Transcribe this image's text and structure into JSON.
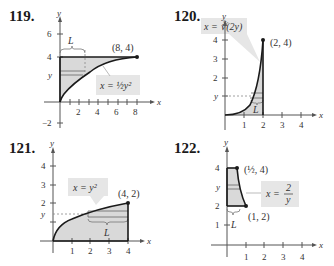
{
  "problems": [
    {
      "number": "119.",
      "axis_x_label": "x",
      "axis_y_label": "y",
      "x_ticks": [
        "2",
        "4",
        "6",
        "8"
      ],
      "y_ticks": [
        "6",
        "4",
        "-2"
      ],
      "y_marker": "y",
      "length_label": "L",
      "equation": "x = ½y²",
      "point_label": "(8, 4)"
    },
    {
      "number": "120.",
      "axis_x_label": "x",
      "axis_y_label": "y",
      "x_ticks": [
        "1",
        "2",
        "3",
        "4"
      ],
      "y_ticks": [
        "4",
        "3",
        "2"
      ],
      "y_marker": "y",
      "length_label": "L",
      "equation": "x = ∛(2y)",
      "point_label": "(2, 4)"
    },
    {
      "number": "121.",
      "axis_x_label": "x",
      "axis_y_label": "y",
      "x_ticks": [
        "1",
        "2",
        "3",
        "4"
      ],
      "y_ticks": [
        "4",
        "3",
        "2"
      ],
      "y_marker": "y",
      "length_label": "L",
      "equation": "x = y²",
      "point_label": "(4, 2)"
    },
    {
      "number": "122.",
      "axis_x_label": "x",
      "axis_y_label": "y",
      "x_ticks": [
        "1",
        "2",
        "3",
        "4"
      ],
      "y_ticks": [
        "4",
        "2",
        "1"
      ],
      "y_marker": "y",
      "length_label": "L",
      "equation": "x = 2/y",
      "point_label_1": "(½, 4)",
      "point_label_2": "(1, 2)"
    }
  ],
  "colors": {
    "shade": "#d9d9d9",
    "label_box": "#e6e6e6",
    "curve": "#1a1a1a",
    "axis": "#555555"
  }
}
